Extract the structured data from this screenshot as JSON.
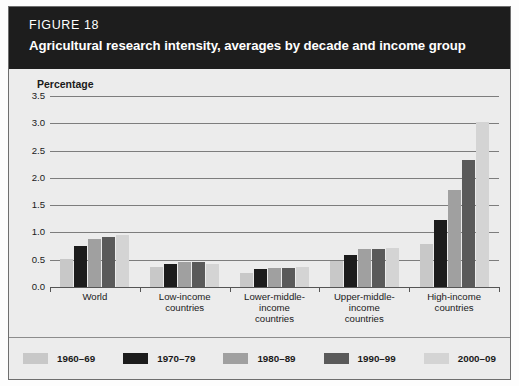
{
  "figure": {
    "number_label": "FIGURE 18",
    "title": "Agricultural research intensity, averages by decade and income group"
  },
  "legend": {
    "items": [
      {
        "label": "1960–69",
        "color": "#c8c8c8"
      },
      {
        "label": "1970–79",
        "color": "#1c1c1c"
      },
      {
        "label": "1980–89",
        "color": "#a0a0a0"
      },
      {
        "label": "1990–99",
        "color": "#5a5a5a"
      },
      {
        "label": "2000–09",
        "color": "#d4d4d4"
      }
    ]
  },
  "chart_data": {
    "type": "bar",
    "title": "Agricultural research intensity, averages by decade and income group",
    "xlabel": "",
    "ylabel": "Percentage",
    "ylim": [
      0.0,
      3.5
    ],
    "yticks": [
      "0.0",
      "0.5",
      "1.0",
      "1.5",
      "2.0",
      "2.5",
      "3.0",
      "3.5"
    ],
    "grid": true,
    "legend_position": "bottom",
    "categories": [
      "World",
      "Low-income countries",
      "Lower-middle-income countries",
      "Upper-middle-income countries",
      "High-income countries"
    ],
    "category_lines": [
      [
        "World"
      ],
      [
        "Low-income",
        "countries"
      ],
      [
        "Lower-middle-",
        "income",
        "countries"
      ],
      [
        "Upper-middle-",
        "income",
        "countries"
      ],
      [
        "High-income",
        "countries"
      ]
    ],
    "series": [
      {
        "name": "1960–69",
        "color": "#c8c8c8",
        "values": [
          0.52,
          0.36,
          0.25,
          0.47,
          0.78
        ]
      },
      {
        "name": "1970–79",
        "color": "#1c1c1c",
        "values": [
          0.75,
          0.42,
          0.33,
          0.58,
          1.22
        ]
      },
      {
        "name": "1980–89",
        "color": "#a0a0a0",
        "values": [
          0.88,
          0.45,
          0.34,
          0.7,
          1.78
        ]
      },
      {
        "name": "1990–99",
        "color": "#5a5a5a",
        "values": [
          0.92,
          0.45,
          0.35,
          0.7,
          2.32
        ]
      },
      {
        "name": "2000–09",
        "color": "#d4d4d4",
        "values": [
          0.95,
          0.42,
          0.37,
          0.72,
          3.03
        ]
      }
    ]
  }
}
